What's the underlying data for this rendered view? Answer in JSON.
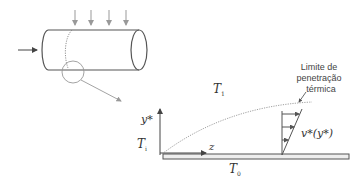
{
  "diagram": {
    "labels": {
      "t_top": "T",
      "t_top_sub": "1",
      "t_left": "T",
      "t_left_sub": "i",
      "t_bottom": "T",
      "t_bottom_sub": "0",
      "y_axis": "y*",
      "z_axis": "z",
      "velocity_profile": "v*(y*)",
      "annotation_line1": "Limite de",
      "annotation_line2": "penetração",
      "annotation_line3": "térmica"
    },
    "colors": {
      "stroke": "#555555",
      "light_stroke": "#999999",
      "plate_fill": "#eeeeee"
    }
  }
}
